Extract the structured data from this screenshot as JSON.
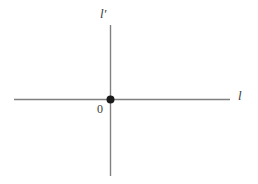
{
  "figure": {
    "kind": "geometry-axes-diagram",
    "width": 258,
    "height": 184,
    "background_color": "#ffffff",
    "stroke_color": "#808080",
    "point_color": "#1a1a1a",
    "text_color": "#3b3b3b"
  },
  "labels": {
    "vertical_axis": "l′",
    "horizontal_axis": "l",
    "origin": "0"
  },
  "geometry": {
    "vertical_line": {
      "x": 110,
      "y_start": 25,
      "y_end": 176
    },
    "horizontal_line": {
      "y": 99,
      "x_start": 14,
      "x_end": 230
    },
    "origin_point": {
      "x": 110,
      "y": 99,
      "radius": 4
    }
  }
}
